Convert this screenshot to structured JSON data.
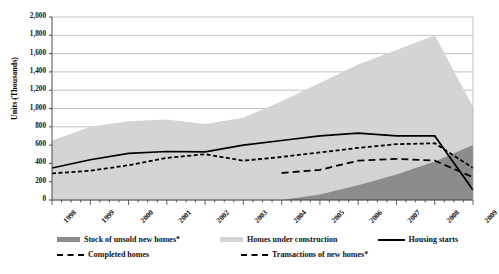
{
  "chart_data": {
    "type": "area",
    "title": "",
    "xlabel": "",
    "ylabel": "Units (Thousands)",
    "ylim": [
      0,
      2000
    ],
    "ytick_step": 200,
    "grid": true,
    "legend_position": "bottom",
    "x": [
      1998,
      1999,
      2000,
      2001,
      2002,
      2003,
      2004,
      2005,
      2006,
      2007,
      2008,
      2009
    ],
    "xtick_labels": [
      "1998",
      "1999",
      "2000",
      "2001",
      "2002",
      "2003",
      "2004",
      "2005",
      "2006",
      "2007",
      "2008",
      "2009"
    ],
    "ytick_labels": [
      "0",
      "200",
      "400",
      "600",
      "800",
      "1,000",
      "1,200",
      "1,400",
      "1,600",
      "1,800",
      "2,000"
    ],
    "series": [
      {
        "name": "Stock of unsold new homes*",
        "render": "area",
        "color": "#8c8c8c",
        "x": [
          1998,
          1999,
          2000,
          2001,
          2002,
          2003,
          2004,
          2005,
          2006,
          2007,
          2008,
          2009
        ],
        "values": [
          0,
          0,
          0,
          0,
          0,
          0,
          0,
          60,
          160,
          280,
          420,
          600
        ]
      },
      {
        "name": "Homes under construction",
        "render": "area",
        "color": "#d4d4d4",
        "x": [
          1998,
          1999,
          2000,
          2001,
          2002,
          2003,
          2004,
          2005,
          2006,
          2007,
          2008,
          2009
        ],
        "values": [
          650,
          800,
          860,
          880,
          830,
          900,
          1080,
          1280,
          1480,
          1640,
          1800,
          1020
        ]
      },
      {
        "name": "Housing starts",
        "render": "line-solid",
        "color": "#000000",
        "x": [
          1998,
          1999,
          2000,
          2001,
          2002,
          2003,
          2004,
          2005,
          2006,
          2007,
          2008,
          2009
        ],
        "values": [
          350,
          440,
          510,
          530,
          525,
          600,
          650,
          700,
          730,
          700,
          700,
          110
        ]
      },
      {
        "name": "Completed homes",
        "render": "line-dashed-fine",
        "color": "#000000",
        "x": [
          1998,
          1999,
          2000,
          2001,
          2002,
          2003,
          2004,
          2005,
          2006,
          2007,
          2008,
          2009
        ],
        "values": [
          290,
          320,
          380,
          460,
          500,
          430,
          470,
          520,
          570,
          610,
          620,
          350
        ]
      },
      {
        "name": "Transactions of new homes*",
        "render": "line-dashed-long",
        "color": "#000000",
        "x": [
          2004,
          2005,
          2006,
          2007,
          2008,
          2009
        ],
        "values": [
          295,
          330,
          430,
          450,
          430,
          250
        ]
      }
    ]
  },
  "axis": {
    "y_title": "Units (Thousands)"
  },
  "legend": {
    "rows": [
      [
        {
          "label": "Stock of unsold new homes*",
          "marker": "swatch-dark",
          "color": "#8c8c8c"
        },
        {
          "label": "Homes under construction",
          "marker": "swatch-light",
          "color": "#d4d4d4"
        },
        {
          "label": "Housing starts",
          "marker": "line-solid",
          "color": "#000000"
        }
      ],
      [
        {
          "label": "Completed homes",
          "marker": "line-dashed-fine",
          "color": "#000000"
        },
        {
          "label": "Transactions of new homes*",
          "marker": "line-dashed-long",
          "color": "#000000"
        }
      ]
    ]
  }
}
